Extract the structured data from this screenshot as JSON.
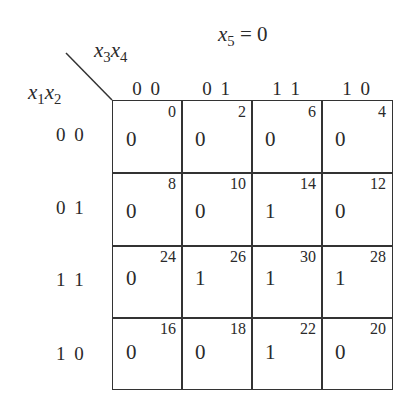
{
  "title": {
    "var": "x",
    "sub": "5",
    "eq": " = 0"
  },
  "column_variables": {
    "a": "x",
    "a_sub": "3",
    "b": "x",
    "b_sub": "4"
  },
  "row_variables": {
    "a": "x",
    "a_sub": "1",
    "b": "x",
    "b_sub": "2"
  },
  "column_headers": [
    "0 0",
    "0 1",
    "1 1",
    "1 0"
  ],
  "row_headers": [
    "0 0",
    "0 1",
    "1 1",
    "1 0"
  ],
  "cells": [
    [
      {
        "minterm": "0",
        "value": "0"
      },
      {
        "minterm": "2",
        "value": "0"
      },
      {
        "minterm": "6",
        "value": "0"
      },
      {
        "minterm": "4",
        "value": "0"
      }
    ],
    [
      {
        "minterm": "8",
        "value": "0"
      },
      {
        "minterm": "10",
        "value": "0"
      },
      {
        "minterm": "14",
        "value": "1"
      },
      {
        "minterm": "12",
        "value": "0"
      }
    ],
    [
      {
        "minterm": "24",
        "value": "0"
      },
      {
        "minterm": "26",
        "value": "1"
      },
      {
        "minterm": "30",
        "value": "1"
      },
      {
        "minterm": "28",
        "value": "1"
      }
    ],
    [
      {
        "minterm": "16",
        "value": "0"
      },
      {
        "minterm": "18",
        "value": "0"
      },
      {
        "minterm": "22",
        "value": "1"
      },
      {
        "minterm": "20",
        "value": "0"
      }
    ]
  ]
}
